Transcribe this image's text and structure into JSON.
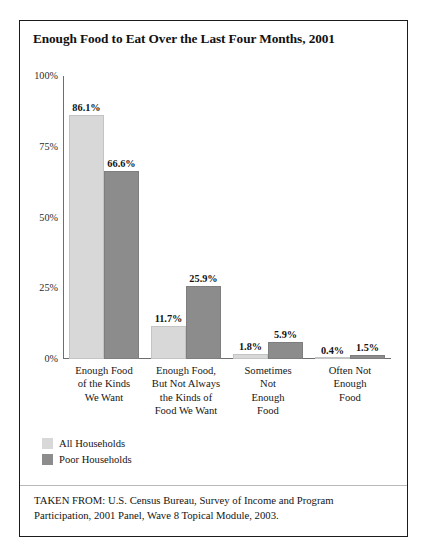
{
  "figure": {
    "title": "Enough Food to Eat Over the Last Four Months, 2001",
    "source_note": "TAKEN FROM: U.S. Census Bureau, Survey of Income and Program Participation, 2001 Panel, Wave 8 Topical Module, 2003."
  },
  "colors": {
    "series_light": "#d8d8d8",
    "series_dark": "#8c8c8c",
    "axis": "#6e6e6e",
    "border": "#1b1b1b",
    "text": "#141414"
  },
  "legend": {
    "items": [
      {
        "label": "All Households",
        "swatch": "#d8d8d8"
      },
      {
        "label": "Poor Households",
        "swatch": "#8c8c8c"
      }
    ]
  },
  "axis": {
    "y_ticks": [
      {
        "label": "100%",
        "value": 100
      },
      {
        "label": "75%",
        "value": 75
      },
      {
        "label": "50%",
        "value": 50
      },
      {
        "label": "25%",
        "value": 25
      },
      {
        "label": "0%",
        "value": 0
      }
    ]
  },
  "chart_data": {
    "type": "bar",
    "title": "Enough Food to Eat Over the Last Four Months, 2001",
    "xlabel": "",
    "ylabel": "",
    "ylim": [
      0,
      100
    ],
    "yticks": [
      0,
      25,
      50,
      75,
      100
    ],
    "ytick_labels": [
      "0%",
      "25%",
      "50%",
      "75%",
      "100%"
    ],
    "grid": false,
    "legend_position": "below-plot-left",
    "value_labels": true,
    "value_label_format": "{v}%",
    "categories": [
      "Enough Food of the Kinds We Want",
      "Enough Food, But Not Always the Kinds of Food We Want",
      "Sometimes Not Enough Food",
      "Often Not Enough Food"
    ],
    "category_label_lines": [
      [
        "Enough Food",
        "of the Kinds",
        "We Want"
      ],
      [
        "Enough Food,",
        "But Not Always",
        "the Kinds of",
        "Food We Want"
      ],
      [
        "Sometimes",
        "Not",
        "Enough",
        "Food"
      ],
      [
        "Often Not",
        "Enough",
        "Food"
      ]
    ],
    "series": [
      {
        "name": "All Households",
        "color": "#d8d8d8",
        "values": [
          86.1,
          11.7,
          1.8,
          0.4
        ],
        "labels": [
          "86.1%",
          "11.7%",
          "1.8%",
          "0.4%"
        ]
      },
      {
        "name": "Poor Households",
        "color": "#8c8c8c",
        "values": [
          66.6,
          25.9,
          5.9,
          1.5
        ],
        "labels": [
          "66.6%",
          "25.9%",
          "5.9%",
          "1.5%"
        ]
      }
    ]
  }
}
